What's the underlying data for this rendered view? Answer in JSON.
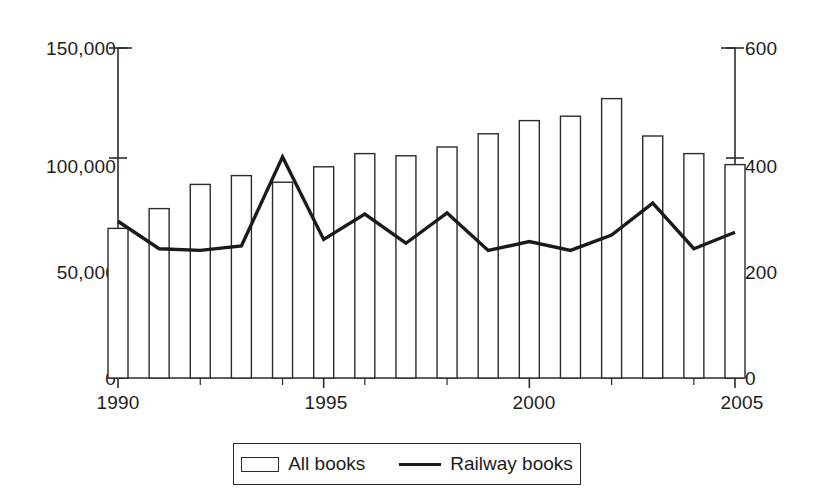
{
  "chart_data": {
    "type": "bar",
    "title": "",
    "subtitle": "",
    "xlabel": "",
    "ylabel": "",
    "grid": false,
    "legend_position": "bottom",
    "x": [
      1990,
      1991,
      1992,
      1993,
      1994,
      1995,
      1996,
      1997,
      1998,
      1999,
      2000,
      2001,
      2002,
      2003,
      2004,
      2005
    ],
    "categories": [
      "1990",
      "1991",
      "1992",
      "1993",
      "1994",
      "1995",
      "1996",
      "1997",
      "1998",
      "1999",
      "2000",
      "2001",
      "2002",
      "2003",
      "2004",
      "2005"
    ],
    "xlim": [
      1990,
      2005
    ],
    "x_tick_labels": [
      "1990",
      "1995",
      "2000",
      "2005"
    ],
    "x_tick_values": [
      1990,
      1995,
      2000,
      2005
    ],
    "x_minor_ticks": true,
    "series": [
      {
        "name": "All books",
        "type": "bar",
        "axis": "left",
        "fill": "#ffffff",
        "stroke": "#2b2b2b",
        "values": [
          68000,
          77000,
          88000,
          92000,
          89000,
          96000,
          102000,
          101000,
          105000,
          111000,
          117000,
          119000,
          127000,
          110000,
          102000,
          97000
        ]
      },
      {
        "name": "Railway books",
        "type": "line",
        "axis": "right",
        "stroke": "#1a1a1a",
        "values": [
          285,
          235,
          232,
          240,
          402,
          252,
          298,
          245,
          300,
          232,
          248,
          232,
          260,
          318,
          235,
          265
        ]
      }
    ],
    "left_axis": {
      "ylim": [
        0,
        150000
      ],
      "tick_values": [
        0,
        50000,
        100000,
        150000
      ],
      "tick_labels": [
        "0",
        "50,000",
        "100,000",
        "150,000"
      ]
    },
    "right_axis": {
      "ylim": [
        0,
        600
      ],
      "tick_values": [
        0,
        200,
        400,
        600
      ],
      "tick_labels": [
        "0",
        "200",
        "400",
        "600"
      ]
    }
  },
  "legend": {
    "items": [
      {
        "label": "All books",
        "marker": "bar-swatch-icon"
      },
      {
        "label": "Railway books",
        "marker": "line-swatch-icon"
      }
    ]
  },
  "axis_labels": {
    "left": [
      "150,000",
      "100,000",
      "50,000",
      "0"
    ],
    "right": [
      "600",
      "400",
      "200",
      "0"
    ],
    "bottom": [
      "1990",
      "1995",
      "2000",
      "2005"
    ]
  }
}
